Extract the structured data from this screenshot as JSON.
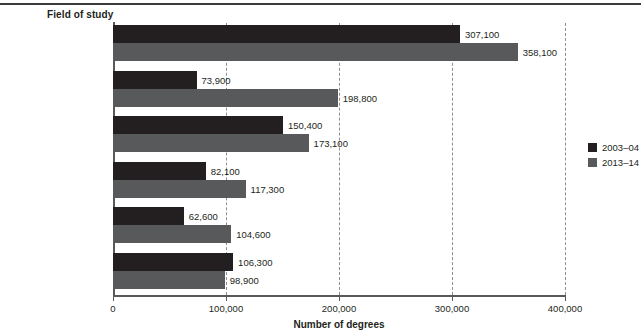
{
  "chart_data": {
    "type": "bar",
    "orientation": "horizontal",
    "title": "",
    "ylabel": "Field of study",
    "xlabel": "Number of degrees",
    "xlim": [
      0,
      400000
    ],
    "xticks": [
      "0",
      "100,000",
      "200,000",
      "300,000",
      "400,000"
    ],
    "xtick_values": [
      0,
      100000,
      200000,
      300000,
      400000
    ],
    "grid": "vertical-dashed",
    "legend_position": "right",
    "categories": [
      "Business",
      "Health professions and\nrelated programs",
      "Social sciences\nand history",
      "Psychology",
      "Biological and\nbiomedical sciences",
      "Education"
    ],
    "series": [
      {
        "name": "2003–04",
        "color": "#231f20",
        "values": [
          307100,
          73900,
          150400,
          82100,
          62600,
          106300
        ],
        "labels": [
          "307,100",
          "73,900",
          "150,400",
          "82,100",
          "62,600",
          "106,300"
        ]
      },
      {
        "name": "2013–14",
        "color": "#58595b",
        "values": [
          358100,
          198800,
          173100,
          117300,
          104600,
          98900
        ],
        "labels": [
          "358,100",
          "198,800",
          "173,100",
          "117,300",
          "104,600",
          "98,900"
        ]
      }
    ]
  },
  "legend": {
    "items": [
      {
        "label": "2003–04",
        "color": "#231f20"
      },
      {
        "label": "2013–14",
        "color": "#58595b"
      }
    ]
  },
  "axis": {
    "y_title": "Field of study",
    "x_title": "Number of degrees"
  }
}
